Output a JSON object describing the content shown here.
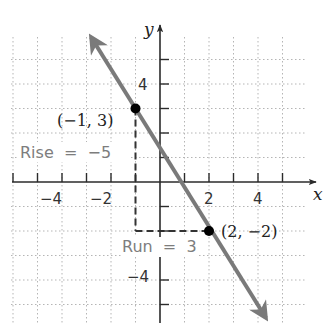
{
  "chart_data": {
    "type": "line",
    "title": "",
    "xlabel": "x",
    "ylabel": "y",
    "xlim": [
      -6,
      6
    ],
    "ylim": [
      -5.8,
      6
    ],
    "grid": true,
    "x_ticks": [
      -6,
      -5,
      -4,
      -3,
      -2,
      -1,
      1,
      2,
      3,
      4,
      5
    ],
    "y_ticks": [
      5,
      4,
      3,
      2,
      1,
      -1,
      -2,
      -3,
      -4,
      -5
    ],
    "x_tick_labels": [
      {
        "value": -4,
        "label": "−4"
      },
      {
        "value": -2,
        "label": "−2"
      },
      {
        "value": 2,
        "label": "2"
      },
      {
        "value": 4,
        "label": "4"
      }
    ],
    "y_tick_labels": [
      {
        "value": 4,
        "label": "4"
      },
      {
        "value": -4,
        "label": "−4"
      }
    ],
    "series": [
      {
        "name": "line through (-1,3) and (2,-2)",
        "slope": -1.6667,
        "x": [
          -2.8,
          4.3
        ],
        "y": [
          6.0,
          -5.8
        ],
        "arrows": "both",
        "color": "#7a7a7a"
      }
    ],
    "points": [
      {
        "x": -1,
        "y": 3,
        "label": "(−1, 3)"
      },
      {
        "x": 2,
        "y": -2,
        "label": "(2, −2)"
      }
    ],
    "annotations": [
      {
        "text": "Rise = −5",
        "type": "vertical-dashed",
        "from": [
          -1,
          3
        ],
        "to": [
          -1,
          -2
        ]
      },
      {
        "text": "Run = 3",
        "type": "horizontal-dashed",
        "from": [
          -1,
          -2
        ],
        "to": [
          2,
          -2
        ]
      }
    ]
  },
  "labels": {
    "x_axis": "x",
    "y_axis": "y",
    "tick_x_neg4": "−4",
    "tick_x_neg2": "−2",
    "tick_x_2": "2",
    "tick_x_4": "4",
    "tick_y_4": "4",
    "tick_y_neg4": "−4",
    "point_a": "(−1, 3)",
    "point_b": "(2, −2)",
    "rise": "Rise  =  −5",
    "run": "Run  =  3"
  },
  "colors": {
    "axis": "#2b2b2b",
    "grid": "#b5b5b5",
    "line": "#7a7a7a",
    "dashed": "#333333",
    "annotation_text": "#7d7d7d",
    "point": "#000000"
  }
}
